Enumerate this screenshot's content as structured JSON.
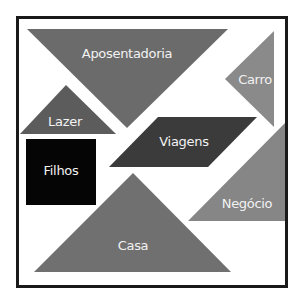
{
  "diagram": {
    "type": "tangram",
    "frame": {
      "border_color": "#1a1a1a",
      "background": "#ffffff"
    },
    "pieces": [
      {
        "id": "aposentadoria",
        "label": "Aposentadoria",
        "shape": "triangle",
        "color": "#6b6b6b"
      },
      {
        "id": "carro",
        "label": "Carro",
        "shape": "triangle",
        "color": "#8a8a8a"
      },
      {
        "id": "lazer",
        "label": "Lazer",
        "shape": "triangle",
        "color": "#5c5c5c"
      },
      {
        "id": "filhos",
        "label": "Filhos",
        "shape": "square",
        "color": "#050505"
      },
      {
        "id": "viagens",
        "label": "Viagens",
        "shape": "parallelogram",
        "color": "#3b3b3b"
      },
      {
        "id": "negocio",
        "label": "Negócio",
        "shape": "triangle",
        "color": "#868686"
      },
      {
        "id": "casa",
        "label": "Casa",
        "shape": "triangle",
        "color": "#707070"
      }
    ]
  }
}
